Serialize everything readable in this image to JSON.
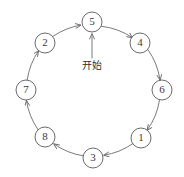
{
  "diagram": {
    "type": "cycle-diagram",
    "title": "",
    "canvas": {
      "width": 184,
      "height": 177,
      "background": "#ffffff"
    },
    "colors": {
      "stroke": "#6b6b6b",
      "node_stroke": "#5a5a5a",
      "node_fill": "#ffffff",
      "text": "#3a3a3a",
      "label_text": "#2e2e2e"
    },
    "geometry": {
      "center_x": 94,
      "center_y": 90,
      "radius": 68,
      "node_radius": 10
    },
    "nodes": [
      {
        "id": "n5",
        "label": "5",
        "cx": 92,
        "cy": 22,
        "angle_deg": 270
      },
      {
        "id": "n4",
        "label": "4",
        "cx": 140,
        "cy": 43,
        "angle_deg": 315
      },
      {
        "id": "n6",
        "label": "6",
        "cx": 162,
        "cy": 90,
        "angle_deg": 0
      },
      {
        "id": "n1",
        "label": "1",
        "cx": 141,
        "cy": 138,
        "angle_deg": 45
      },
      {
        "id": "n3",
        "label": "3",
        "cx": 93,
        "cy": 158,
        "angle_deg": 90
      },
      {
        "id": "n8",
        "label": "8",
        "cx": 45,
        "cy": 137,
        "angle_deg": 135
      },
      {
        "id": "n7",
        "label": "7",
        "cx": 26,
        "cy": 90,
        "angle_deg": 180
      },
      {
        "id": "n2",
        "label": "2",
        "cx": 45,
        "cy": 43,
        "angle_deg": 225
      }
    ],
    "edges": [
      {
        "from": "5",
        "to": "4",
        "direction": "clockwise"
      },
      {
        "from": "4",
        "to": "6",
        "direction": "clockwise"
      },
      {
        "from": "6",
        "to": "1",
        "direction": "clockwise"
      },
      {
        "from": "1",
        "to": "3",
        "direction": "clockwise"
      },
      {
        "from": "3",
        "to": "8",
        "direction": "clockwise"
      },
      {
        "from": "8",
        "to": "7",
        "direction": "clockwise"
      },
      {
        "from": "7",
        "to": "2",
        "direction": "clockwise"
      },
      {
        "from": "2",
        "to": "5",
        "direction": "clockwise"
      }
    ],
    "annotation": {
      "text": "开始",
      "x": 92,
      "y": 64,
      "points_to": "5",
      "arrow_from_y": 58,
      "arrow_to_y": 34
    }
  }
}
